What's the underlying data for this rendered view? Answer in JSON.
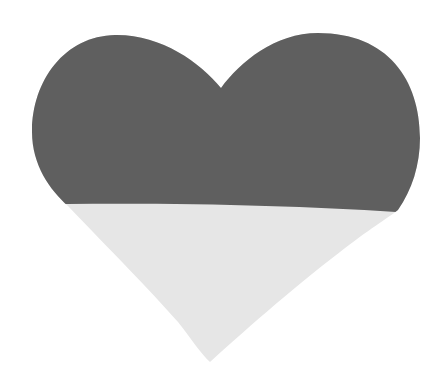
{
  "image": {
    "subject": "heart",
    "description": "Two-tone heart shape: dark gray upper portion, light gray lower portion",
    "colors": {
      "background": "#ffffff",
      "upper": "#5f5f5f",
      "lower": "#e6e6e6"
    }
  }
}
